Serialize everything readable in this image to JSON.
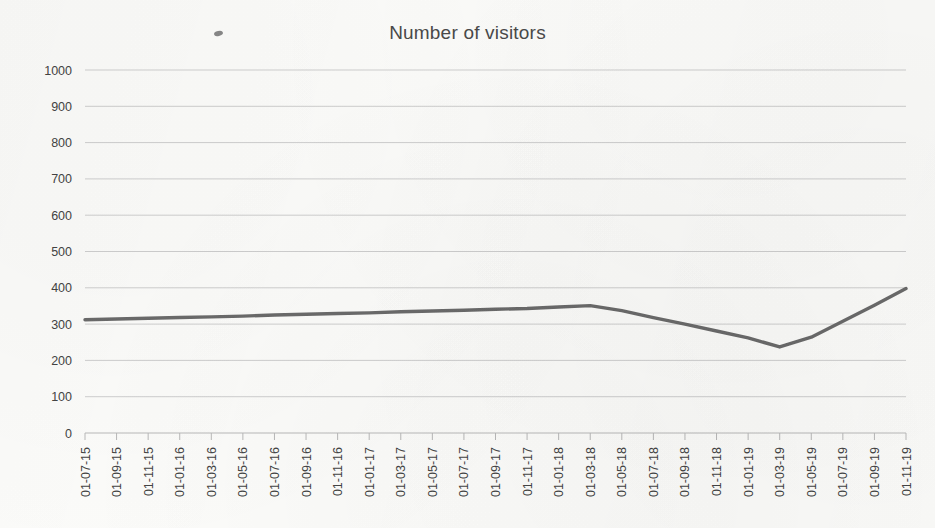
{
  "chart_data": {
    "type": "line",
    "title": "Number of visitors",
    "xlabel": "",
    "ylabel": "",
    "ylim": [
      0,
      1000
    ],
    "ytick_step": 100,
    "yticks": [
      0,
      100,
      200,
      300,
      400,
      500,
      600,
      700,
      800,
      900,
      1000
    ],
    "grid": true,
    "legend": false,
    "legend_position": "none",
    "line_color": "#6b6b6b",
    "categories": [
      "01-07-15",
      "01-09-15",
      "01-11-15",
      "01-01-16",
      "01-03-16",
      "01-05-16",
      "01-07-16",
      "01-09-16",
      "01-11-16",
      "01-01-17",
      "01-03-17",
      "01-05-17",
      "01-07-17",
      "01-09-17",
      "01-11-17",
      "01-01-18",
      "01-03-18",
      "01-05-18",
      "01-07-18",
      "01-09-18",
      "01-11-18",
      "01-01-19",
      "01-03-19",
      "01-05-19",
      "01-07-19",
      "01-09-19",
      "01-11-19"
    ],
    "values": [
      312,
      314,
      316,
      318,
      320,
      322,
      325,
      327,
      329,
      331,
      334,
      336,
      338,
      341,
      343,
      347,
      351,
      337,
      318,
      300,
      281,
      262,
      237,
      264,
      308,
      352,
      398
    ],
    "series": [
      {
        "name": "Number of visitors",
        "values": [
          312,
          314,
          316,
          318,
          320,
          322,
          325,
          327,
          329,
          331,
          334,
          336,
          338,
          341,
          343,
          347,
          351,
          337,
          318,
          300,
          281,
          262,
          237,
          264,
          308,
          352,
          398
        ]
      }
    ],
    "annotations": []
  },
  "artifacts": {
    "speck_name": "scan-speck-mark"
  }
}
